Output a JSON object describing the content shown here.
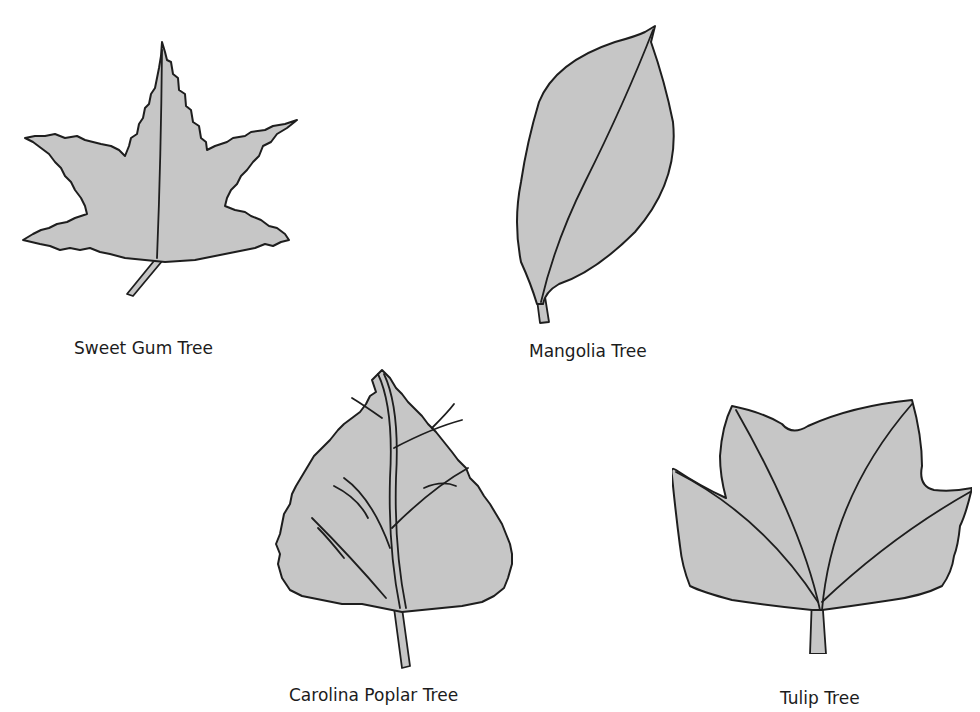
{
  "figure": {
    "leaves": [
      {
        "name": "sweet-gum",
        "label": "Sweet Gum Tree",
        "shape": "star-shaped, five pointed serrated lobes"
      },
      {
        "name": "mangolia",
        "label": "Mangolia Tree",
        "shape": "elliptical, smooth margin"
      },
      {
        "name": "carolina-poplar",
        "label": "Carolina Poplar Tree",
        "shape": "triangular/heart-shaped, serrated margin"
      },
      {
        "name": "tulip",
        "label": "Tulip Tree",
        "shape": "four-lobed with truncated tip"
      }
    ],
    "colors": {
      "leaf_fill": "#c6c6c6",
      "outline": "#1e1e1e",
      "background": "#ffffff"
    }
  }
}
